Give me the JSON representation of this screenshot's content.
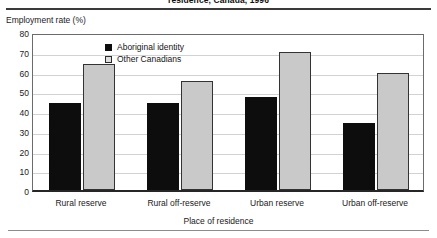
{
  "figure": {
    "title_partial": "residence, Canada, 1996"
  },
  "axes": {
    "y_axis_title": "Employment rate (%)",
    "x_axis_title": "Place of residence"
  },
  "legend": {
    "items": [
      {
        "label": "Aboriginal identity",
        "swatch": "dark-square-icon",
        "color": "#0d0d0d"
      },
      {
        "label": "Other Canadians",
        "swatch": "light-square-icon",
        "color": "#c9c9c9"
      }
    ]
  },
  "chart_data": {
    "type": "bar",
    "title": "residence, Canada, 1996",
    "xlabel": "Place of residence",
    "ylabel": "Employment rate (%)",
    "ylim": [
      0,
      80
    ],
    "yticks": [
      0,
      10,
      20,
      30,
      40,
      50,
      60,
      70,
      80
    ],
    "grid": true,
    "legend_position": "inside-top-center",
    "categories": [
      "Rural reserve",
      "Rural off-reserve",
      "Urban reserve",
      "Urban off-reserve"
    ],
    "series": [
      {
        "name": "Aboriginal identity",
        "color": "#0d0d0d",
        "values": [
          44,
          44,
          47,
          34
        ]
      },
      {
        "name": "Other Canadians",
        "color": "#c9c9c9",
        "values": [
          64,
          55,
          70,
          59
        ]
      }
    ]
  }
}
